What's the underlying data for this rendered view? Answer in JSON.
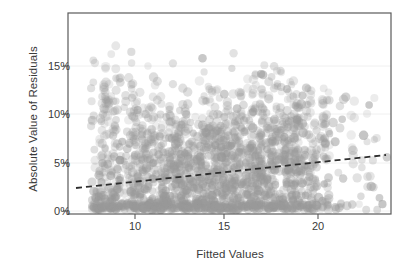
{
  "chart_data": {
    "type": "scatter",
    "title": "",
    "xlabel": "Fitted Values",
    "ylabel": "Absolute Value of Residuals",
    "xlim": [
      7.0,
      23.8
    ],
    "ylim": [
      -0.004,
      0.195
    ],
    "grid": "faint horizontal gridlines at y ticks",
    "legend": "none",
    "xticks": [
      {
        "value": 10,
        "label": "10"
      },
      {
        "value": 15,
        "label": "15"
      },
      {
        "value": 20,
        "label": "20"
      }
    ],
    "yticks": [
      {
        "value": 0.0,
        "label": "0%"
      },
      {
        "value": 0.05,
        "label": "5%"
      },
      {
        "value": 0.1,
        "label": "10%"
      },
      {
        "value": 0.15,
        "label": "15%"
      }
    ],
    "point_style": {
      "color": "#9a9a9a",
      "opacity": 0.3,
      "radius_px": 4.2,
      "marker": "circle"
    },
    "trend_line": {
      "style": "dashed",
      "color": "#2e2e2e",
      "width_px": 1.8,
      "x_start": 7.35,
      "y_start": 0.023,
      "x_end": 23.4,
      "y_end": 0.058,
      "description": "increasing dashed linear fit from about 2.3% at the left edge to about 5.8% at the right edge"
    },
    "panel": {
      "background": "#ffffff",
      "border_color": "#555555",
      "x_px": [
        68,
        391
      ],
      "y_px": [
        13,
        214
      ]
    },
    "series": [
      {
        "name": "Absolute residuals",
        "n_points_drawn": 2600,
        "description": "Dense heteroskedastic cloud of absolute residuals. Mass is concentrated near 0% along the whole x range and fans upward; widest vertical spread between fitted values 9 and 18 reaching about 18-19%. Points form repeated parallel diagonal striations (discrete response values) sloping both up-right and down-right. Density thins sharply past fitted value 20, leaving sparse isolated points out to 23.5 and up to about 12%.",
        "x_range": [
          7.2,
          23.6
        ],
        "y_range": [
          0.0,
          0.19
        ],
        "bands": [
          {
            "x": 7.5,
            "y_median": 0.018,
            "y_p90": 0.075,
            "y_max": 0.14
          },
          {
            "x": 9.0,
            "y_median": 0.024,
            "y_p90": 0.095,
            "y_max": 0.175
          },
          {
            "x": 10.5,
            "y_median": 0.028,
            "y_p90": 0.105,
            "y_max": 0.19
          },
          {
            "x": 12.0,
            "y_median": 0.032,
            "y_p90": 0.115,
            "y_max": 0.19
          },
          {
            "x": 13.5,
            "y_median": 0.035,
            "y_p90": 0.115,
            "y_max": 0.175
          },
          {
            "x": 15.0,
            "y_median": 0.038,
            "y_p90": 0.11,
            "y_max": 0.165
          },
          {
            "x": 16.5,
            "y_median": 0.042,
            "y_p90": 0.105,
            "y_max": 0.155
          },
          {
            "x": 18.0,
            "y_median": 0.045,
            "y_p90": 0.1,
            "y_max": 0.14
          },
          {
            "x": 19.5,
            "y_median": 0.046,
            "y_p90": 0.085,
            "y_max": 0.125
          },
          {
            "x": 21.0,
            "y_median": 0.045,
            "y_p90": 0.07,
            "y_max": 0.12
          },
          {
            "x": 22.5,
            "y_median": 0.045,
            "y_p90": 0.065,
            "y_max": 0.12
          }
        ]
      }
    ]
  }
}
